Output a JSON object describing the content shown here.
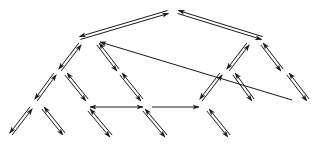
{
  "diagram": {
    "stroke_color": "#1a1a1a",
    "background": "#ffffff",
    "pair_offset": 3,
    "arrow_pairs": [
      {
        "id": "root-left",
        "from": [
          168,
          12
        ],
        "to": [
          80,
          38
        ]
      },
      {
        "id": "root-right",
        "from": [
          178,
          12
        ],
        "to": [
          262,
          38
        ]
      },
      {
        "id": "a-left",
        "from": [
          80,
          44
        ],
        "to": [
          60,
          70
        ]
      },
      {
        "id": "a-right",
        "from": [
          98,
          44
        ],
        "to": [
          118,
          70
        ]
      },
      {
        "id": "b-left",
        "from": [
          248,
          44
        ],
        "to": [
          228,
          70
        ]
      },
      {
        "id": "b-right",
        "from": [
          262,
          44
        ],
        "to": [
          282,
          70
        ]
      },
      {
        "id": "a1-left",
        "from": [
          55,
          74
        ],
        "to": [
          36,
          100
        ]
      },
      {
        "id": "a1-right",
        "from": [
          66,
          74
        ],
        "to": [
          87,
          100
        ]
      },
      {
        "id": "a2-right",
        "from": [
          121,
          74
        ],
        "to": [
          142,
          100
        ]
      },
      {
        "id": "b1-left",
        "from": [
          221,
          74
        ],
        "to": [
          201,
          100
        ]
      },
      {
        "id": "b1-right",
        "from": [
          234,
          74
        ],
        "to": [
          253,
          100
        ]
      },
      {
        "id": "b2-right",
        "from": [
          288,
          74
        ],
        "to": [
          308,
          100
        ]
      },
      {
        "id": "c1-left",
        "from": [
          31,
          108
        ],
        "to": [
          11,
          134
        ]
      },
      {
        "id": "c1-right",
        "from": [
          43,
          108
        ],
        "to": [
          64,
          134
        ]
      },
      {
        "id": "c2-right",
        "from": [
          89,
          110
        ],
        "to": [
          111,
          136
        ]
      },
      {
        "id": "c3-right",
        "from": [
          144,
          110
        ],
        "to": [
          166,
          136
        ]
      },
      {
        "id": "c4-right",
        "from": [
          208,
          110
        ],
        "to": [
          229,
          136
        ]
      }
    ],
    "single_arrows": [
      {
        "id": "long-back-arrow",
        "from": [
          292,
          100
        ],
        "to": [
          100,
          42
        ],
        "heads": "end"
      },
      {
        "id": "horizontal-double",
        "from": [
          90,
          107
        ],
        "to": [
          143,
          107
        ],
        "heads": "both"
      },
      {
        "id": "horizontal-right",
        "from": [
          152,
          107
        ],
        "to": [
          199,
          107
        ],
        "heads": "end"
      }
    ]
  }
}
